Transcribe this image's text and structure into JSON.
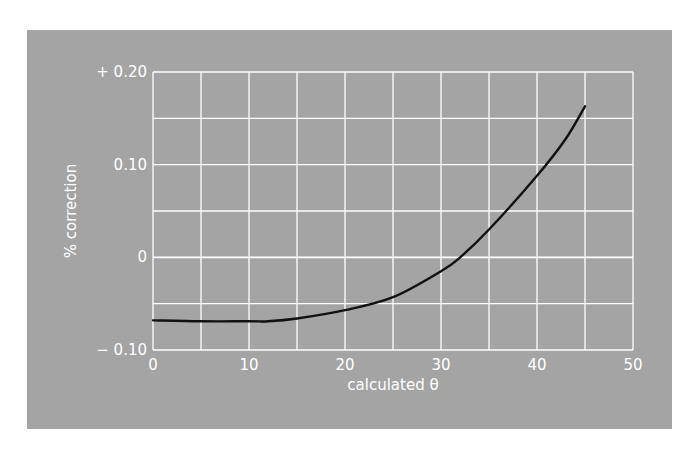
{
  "chart_data": {
    "type": "line",
    "title": "",
    "xlabel": "calculated θ",
    "ylabel": "% correction",
    "xlim": [
      0,
      50
    ],
    "ylim": [
      -0.1,
      0.2
    ],
    "x_ticks": [
      0,
      10,
      20,
      30,
      40,
      50
    ],
    "x_tick_labels": [
      "0",
      "10",
      "20",
      "30",
      "40",
      "50"
    ],
    "y_ticks": [
      -0.1,
      0,
      0.1,
      0.2
    ],
    "y_tick_labels": [
      "− 0.10",
      "0",
      "0.10",
      "+ 0.20"
    ],
    "grid": true,
    "grid_x_step": 5,
    "grid_y_step": 0.05,
    "legend": null,
    "series": [
      {
        "name": "% correction",
        "color": "#111111",
        "x": [
          0,
          5,
          10,
          12,
          15,
          20,
          25,
          30,
          32,
          35,
          40,
          43,
          45
        ],
        "y": [
          -0.068,
          -0.069,
          -0.069,
          -0.069,
          -0.066,
          -0.057,
          -0.043,
          -0.015,
          0.0,
          0.03,
          0.088,
          0.128,
          0.163
        ]
      }
    ]
  },
  "colors": {
    "panel_background": "#a4a4a4",
    "grid": "#ffffff",
    "text": "#ffffff",
    "curve": "#111111"
  }
}
